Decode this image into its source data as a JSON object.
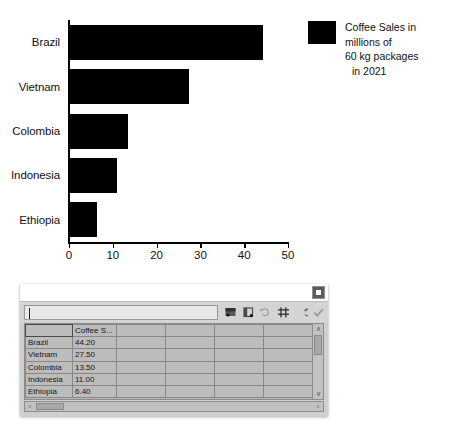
{
  "chart_data": {
    "type": "bar",
    "orientation": "horizontal",
    "title": "",
    "xlabel": "",
    "ylabel": "",
    "categories": [
      "Brazil",
      "Vietnam",
      "Colombia",
      "Indonesia",
      "Ethiopia"
    ],
    "values": [
      44.2,
      27.5,
      13.5,
      11.0,
      6.4
    ],
    "series": [
      {
        "name": "Coffee Sales in millions of 60 kg packages in 2021",
        "values": [
          44.2,
          27.5,
          13.5,
          11.0,
          6.4
        ],
        "color": "#000000"
      }
    ],
    "xlim": [
      0,
      50
    ],
    "xticks": [
      0,
      10,
      20,
      30,
      40,
      50
    ],
    "xtick_labels": [
      "0",
      "10",
      "20",
      "30",
      "40",
      "50"
    ],
    "grid": false,
    "legend_position": "right",
    "legend": {
      "line1": "Coffee Sales in millions of",
      "line2": "60 kg packages",
      "line3": "in 2021",
      "swatch_color": "#000000"
    }
  },
  "dialog": {
    "name": "data-table",
    "close_label": "×",
    "cell_input": {
      "value": "",
      "placeholder": ""
    },
    "toolbar": {
      "buttons": [
        {
          "name": "insert-row-button",
          "label": "Insert Row",
          "enabled": true
        },
        {
          "name": "insert-series-button",
          "label": "Insert Series",
          "enabled": true
        },
        {
          "name": "insert-text-column-button",
          "label": "Insert Text Column",
          "enabled": false
        },
        {
          "name": "delete-row-button",
          "label": "Delete Row",
          "enabled": true
        },
        {
          "name": "delete-series-button",
          "label": "Delete Series",
          "enabled": true
        },
        {
          "name": "accept-button",
          "label": "Accept",
          "enabled": false
        }
      ]
    },
    "grid": {
      "headers": [
        "",
        "Coffee S...",
        "",
        "",
        "",
        "",
        ""
      ],
      "rows": [
        {
          "category": "Brazil",
          "value": "44.20",
          "extra": [
            "",
            "",
            "",
            "",
            ""
          ]
        },
        {
          "category": "Vietnam",
          "value": "27.50",
          "extra": [
            "",
            "",
            "",
            "",
            ""
          ]
        },
        {
          "category": "Colombia",
          "value": "13.50",
          "extra": [
            "",
            "",
            "",
            "",
            ""
          ]
        },
        {
          "category": "Indonesia",
          "value": "11.00",
          "extra": [
            "",
            "",
            "",
            "",
            ""
          ]
        },
        {
          "category": "Ethiopia",
          "value": "6.40",
          "extra": [
            "",
            "",
            "",
            "",
            ""
          ]
        }
      ]
    },
    "scroll": {
      "up_arrow": "∧",
      "down_arrow": "∨",
      "left_arrow": "‹",
      "right_arrow": "›"
    }
  }
}
